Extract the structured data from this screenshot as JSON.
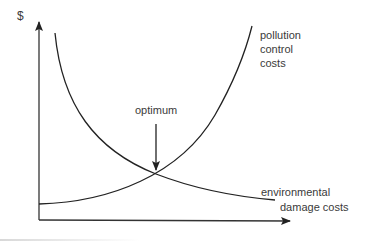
{
  "diagram": {
    "y_axis_label": "$",
    "curves": [
      {
        "name": "pollution control costs",
        "label_lines": [
          "pollution",
          "control",
          "costs"
        ],
        "trend": "increasing",
        "points": [
          [
            39,
            204
          ],
          [
            90,
            198
          ],
          [
            130,
            185
          ],
          [
            156,
            174
          ],
          [
            190,
            150
          ],
          [
            220,
            105
          ],
          [
            240,
            62
          ],
          [
            252,
            26
          ]
        ]
      },
      {
        "name": "environmental damage costs",
        "label_lines": [
          "environmental",
          "damage costs"
        ],
        "trend": "decreasing",
        "points": [
          [
            55,
            33
          ],
          [
            62,
            80
          ],
          [
            80,
            115
          ],
          [
            110,
            145
          ],
          [
            156,
            174
          ],
          [
            210,
            192
          ],
          [
            275,
            200
          ]
        ]
      }
    ],
    "annotation": {
      "label": "optimum",
      "arrow_from": [
        156,
        124
      ],
      "arrow_to": [
        156,
        170
      ]
    },
    "intersection": [
      156,
      174
    ],
    "colors": {
      "stroke": "#222222",
      "text": "#3a3a3a"
    }
  }
}
